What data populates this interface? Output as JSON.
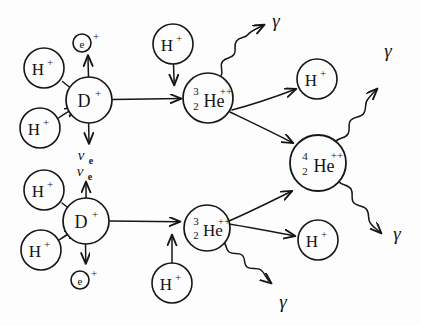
{
  "diagram": {
    "style": "hand-drawn sketch, black ink on white paper",
    "nodes": [
      {
        "id": "p1-top",
        "kind": "proton",
        "label": "H",
        "charge": "+",
        "cx": 44,
        "cy": 68,
        "r": 20
      },
      {
        "id": "p2-top",
        "kind": "proton",
        "label": "H",
        "charge": "+",
        "cx": 40,
        "cy": 128,
        "r": 20
      },
      {
        "id": "d-top",
        "kind": "deuteron",
        "label": "D",
        "charge": "+",
        "cx": 89,
        "cy": 100,
        "r": 23
      },
      {
        "id": "p3-top",
        "kind": "proton",
        "label": "H",
        "charge": "+",
        "cx": 173,
        "cy": 44,
        "r": 20
      },
      {
        "id": "he3-top",
        "kind": "helium3",
        "label": "He",
        "charge": "++",
        "mass": "3",
        "atomic": "2",
        "cx": 208,
        "cy": 98,
        "r": 25
      },
      {
        "id": "p-out-top",
        "kind": "proton",
        "label": "H",
        "charge": "+",
        "cx": 317,
        "cy": 79,
        "r": 20
      },
      {
        "id": "he4",
        "kind": "helium4",
        "label": "He",
        "charge": "++",
        "mass": "4",
        "atomic": "2",
        "cx": 318,
        "cy": 163,
        "r": 28
      },
      {
        "id": "p1-bot",
        "kind": "proton",
        "label": "H",
        "charge": "+",
        "cx": 44,
        "cy": 190,
        "r": 20
      },
      {
        "id": "p2-bot",
        "kind": "proton",
        "label": "H",
        "charge": "+",
        "cx": 41,
        "cy": 250,
        "r": 20
      },
      {
        "id": "d-bot",
        "kind": "deuteron",
        "label": "D",
        "charge": "+",
        "cx": 86,
        "cy": 221,
        "r": 23
      },
      {
        "id": "p3-bot",
        "kind": "proton",
        "label": "H",
        "charge": "+",
        "cx": 172,
        "cy": 283,
        "r": 20
      },
      {
        "id": "he3-bot",
        "kind": "helium3",
        "label": "He",
        "charge": "++",
        "mass": "3",
        "atomic": "2",
        "cx": 207,
        "cy": 228,
        "r": 23
      },
      {
        "id": "p-out-bot",
        "kind": "proton",
        "label": "H",
        "charge": "+",
        "cx": 318,
        "cy": 240,
        "r": 20
      }
    ],
    "particles": [
      {
        "id": "positron-top",
        "kind": "positron",
        "label": "e",
        "charge": "+",
        "cx": 82,
        "cy": 43,
        "r": 9
      },
      {
        "id": "neutrino-top",
        "kind": "neutrino",
        "symbol": "ν",
        "subscript": "e",
        "x": 81,
        "y": 160
      },
      {
        "id": "neutrino-bot",
        "kind": "neutrino",
        "symbol": "ν",
        "subscript": "e",
        "x": 80,
        "y": 176
      },
      {
        "id": "positron-bot",
        "kind": "positron",
        "label": "e",
        "charge": "+",
        "cx": 80,
        "cy": 280,
        "r": 9
      },
      {
        "id": "gamma-1",
        "kind": "gamma",
        "symbol": "γ",
        "x": 276,
        "y": 27
      },
      {
        "id": "gamma-2",
        "kind": "gamma",
        "symbol": "γ",
        "x": 388,
        "y": 57
      },
      {
        "id": "gamma-3",
        "kind": "gamma",
        "symbol": "γ",
        "x": 397,
        "y": 240
      },
      {
        "id": "gamma-4",
        "kind": "gamma",
        "symbol": "γ",
        "x": 283,
        "y": 308
      }
    ],
    "arrows": [
      {
        "id": "a-p1top-to-dtop",
        "from": "p1-top",
        "to": "d-top",
        "type": "straight"
      },
      {
        "id": "a-p2top-to-dtop",
        "from": "p2-top",
        "to": "d-top",
        "type": "straight"
      },
      {
        "id": "a-dtop-to-positron",
        "from": "d-top",
        "to": "positron-top",
        "type": "straight"
      },
      {
        "id": "a-dtop-to-neutrino",
        "from": "d-top",
        "to": "neutrino-top",
        "type": "straight"
      },
      {
        "id": "a-dtop-to-he3top",
        "from": "d-top",
        "to": "he3-top",
        "type": "straight"
      },
      {
        "id": "a-p3top-to-he3top",
        "from": "p3-top",
        "to": "he3-top",
        "type": "straight"
      },
      {
        "id": "a-he3top-to-gamma1",
        "from": "he3-top",
        "to": "gamma-1",
        "type": "wavy"
      },
      {
        "id": "a-he3top-to-pout",
        "from": "he3-top",
        "to": "p-out-top",
        "type": "straight"
      },
      {
        "id": "a-he3top-to-he4",
        "from": "he3-top",
        "to": "he4",
        "type": "straight"
      },
      {
        "id": "a-p1bot-to-dbot",
        "from": "p1-bot",
        "to": "d-bot",
        "type": "straight"
      },
      {
        "id": "a-p2bot-to-dbot",
        "from": "p2-bot",
        "to": "d-bot",
        "type": "straight"
      },
      {
        "id": "a-dbot-to-neutrino",
        "from": "d-bot",
        "to": "neutrino-bot",
        "type": "straight"
      },
      {
        "id": "a-dbot-to-positron",
        "from": "d-bot",
        "to": "positron-bot",
        "type": "straight"
      },
      {
        "id": "a-dbot-to-he3bot",
        "from": "d-bot",
        "to": "he3-bot",
        "type": "straight"
      },
      {
        "id": "a-p3bot-to-he3bot",
        "from": "p3-bot",
        "to": "he3-bot",
        "type": "straight"
      },
      {
        "id": "a-he3bot-to-he4",
        "from": "he3-bot",
        "to": "he4",
        "type": "straight"
      },
      {
        "id": "a-he3bot-to-pout",
        "from": "he3-bot",
        "to": "p-out-bot",
        "type": "straight"
      },
      {
        "id": "a-he3bot-to-gamma4",
        "from": "he3-bot",
        "to": "gamma-4",
        "type": "wavy"
      },
      {
        "id": "a-he4-to-gamma2",
        "from": "he4",
        "to": "gamma-2",
        "type": "wavy"
      },
      {
        "id": "a-he4-to-gamma3",
        "from": "he4",
        "to": "gamma-3",
        "type": "wavy"
      }
    ],
    "colors": {
      "ink": "#161616",
      "paper": "#fdfdfd"
    }
  }
}
